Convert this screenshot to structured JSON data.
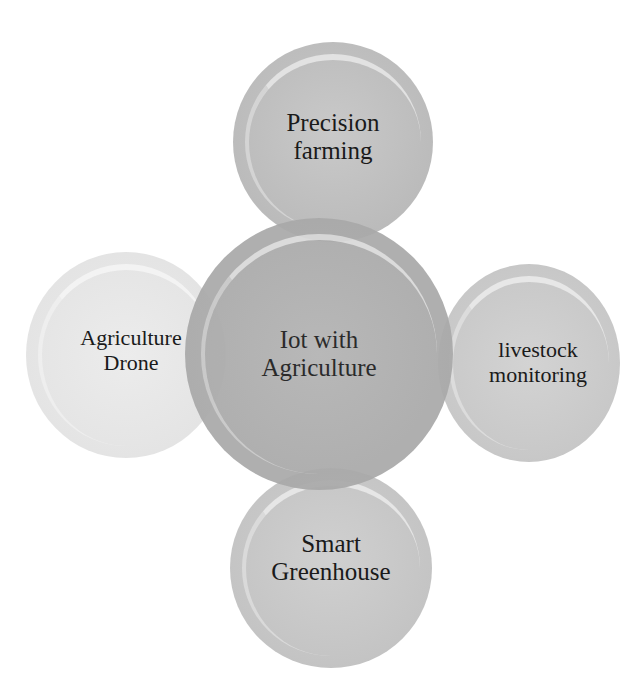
{
  "diagram": {
    "type": "cycle-bubble-diagram",
    "center": {
      "label": "Iot with\nAgriculture"
    },
    "nodes": [
      {
        "position": "top",
        "label": "Precision\nfarming"
      },
      {
        "position": "left",
        "label": "Agriculture\nDrone"
      },
      {
        "position": "right",
        "label": "livestock\nmonitoring"
      },
      {
        "position": "bottom",
        "label": "Smart\nGreenhouse"
      }
    ],
    "colors": {
      "center": "#a9a9a9",
      "top": "#bdbdbd",
      "left": "#e4e4e4",
      "right": "#c8c8c8",
      "bottom": "#c4c4c4",
      "text": "#1a1a1a",
      "background": "#ffffff"
    }
  }
}
